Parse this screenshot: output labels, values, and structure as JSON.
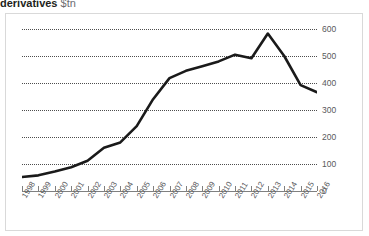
{
  "title": {
    "main": "derivatives",
    "unit": "$tn"
  },
  "chart_data": {
    "type": "line",
    "title": "derivatives $tn",
    "xlabel": "",
    "ylabel": "$tn",
    "ylim": [
      0,
      600
    ],
    "yticks": [
      0,
      100,
      200,
      300,
      400,
      500,
      600
    ],
    "ytick_labels": [
      "0",
      "100",
      "200",
      "300",
      "400",
      "500",
      "600"
    ],
    "grid": true,
    "legend": false,
    "categories": [
      "1998",
      "1999",
      "2000",
      "2001",
      "2002",
      "2003",
      "2004",
      "2005",
      "2006",
      "2007",
      "2008",
      "2009",
      "2010",
      "2011",
      "2012",
      "2013",
      "2014",
      "2015",
      "2016"
    ],
    "values": [
      52,
      58,
      72,
      88,
      112,
      160,
      180,
      240,
      340,
      418,
      445,
      462,
      480,
      505,
      492,
      583,
      500,
      392,
      366
    ],
    "series": [
      {
        "name": "derivatives",
        "color": "#1a1a1a",
        "values": [
          52,
          58,
          72,
          88,
          112,
          160,
          180,
          240,
          340,
          418,
          445,
          462,
          480,
          505,
          492,
          583,
          500,
          392,
          366
        ]
      }
    ]
  }
}
